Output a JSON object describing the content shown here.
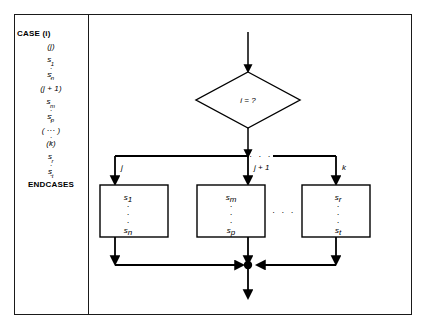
{
  "figure": {
    "name": "case-statement-flowchart",
    "panels": {
      "code": {
        "title": "pseudo-code-panel",
        "lines": [
          {
            "id": "l1",
            "kind": "keyword",
            "text": "CASE (i)"
          },
          {
            "id": "l2",
            "kind": "label",
            "text": "(j)"
          },
          {
            "id": "l3",
            "kind": "stmt",
            "base": "s",
            "sub": "1"
          },
          {
            "id": "l4",
            "kind": "dots",
            "text": "···"
          },
          {
            "id": "l5",
            "kind": "stmt",
            "base": "s",
            "sub": "n"
          },
          {
            "id": "l6",
            "kind": "label",
            "text": "(j + 1)"
          },
          {
            "id": "l7",
            "kind": "stmt",
            "base": "s",
            "sub": "m"
          },
          {
            "id": "l8",
            "kind": "dots",
            "text": "···"
          },
          {
            "id": "l9",
            "kind": "stmt",
            "base": "s",
            "sub": "p"
          },
          {
            "id": "l10",
            "kind": "label",
            "text": "( ··· )"
          },
          {
            "id": "l11",
            "kind": "dots",
            "text": "···"
          },
          {
            "id": "l12",
            "kind": "label",
            "text": "(k)"
          },
          {
            "id": "l13",
            "kind": "stmt",
            "base": "s",
            "sub": "r"
          },
          {
            "id": "l14",
            "kind": "dots",
            "text": "···"
          },
          {
            "id": "l15",
            "kind": "stmt",
            "base": "s",
            "sub": "t"
          },
          {
            "id": "l16",
            "kind": "keyword_end",
            "text": "ENDCASES"
          }
        ]
      },
      "flowchart": {
        "title": "flowchart-panel",
        "decision": {
          "label": "i = ?"
        },
        "branch_labels": [
          {
            "id": "b1",
            "text": "j"
          },
          {
            "id": "b2",
            "text": "j + 1"
          },
          {
            "id": "b3",
            "text": "k"
          }
        ],
        "ellipsis_top": "·  ·  ·",
        "ellipsis_mid": "·  ·  ·",
        "ellipsis_bottom": "·  ·  ·",
        "process_boxes": [
          {
            "id": "box1",
            "first_base": "s",
            "first_sub": "1",
            "dots": "···",
            "last_base": "s",
            "last_sub": "n"
          },
          {
            "id": "box2",
            "first_base": "s",
            "first_sub": "m",
            "dots": "···",
            "last_base": "s",
            "last_sub": "p"
          },
          {
            "id": "box3",
            "first_base": "s",
            "first_sub": "r",
            "dots": "···",
            "last_base": "s",
            "last_sub": "t"
          }
        ],
        "junction": {
          "name": "merge-junction-dot"
        }
      }
    },
    "colors": {
      "stroke": "#1a1a1a",
      "ink": "#000000",
      "background": "#ffffff"
    }
  }
}
